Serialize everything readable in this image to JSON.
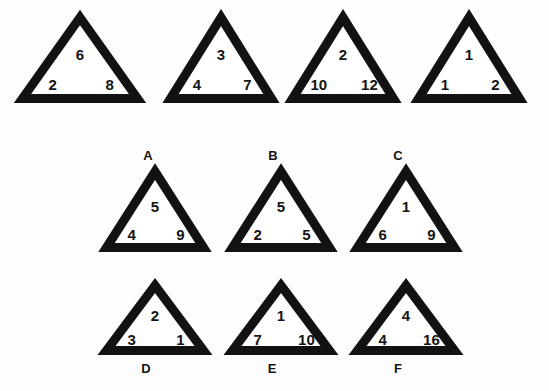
{
  "page": {
    "background_color": "#fdfdfd",
    "ink_color": "#121212",
    "kind": "numeric-analogy-triangle-puzzle"
  },
  "examples": [
    {
      "id": "example-1",
      "top": "6",
      "left": "2",
      "right": "8",
      "label": "",
      "box": {
        "x": 18,
        "y": 13,
        "w": 124,
        "h": 90
      },
      "stroke": 9
    },
    {
      "id": "example-2",
      "top": "3",
      "left": "4",
      "right": "7",
      "label": "",
      "box": {
        "x": 166,
        "y": 13,
        "w": 110,
        "h": 90
      },
      "stroke": 9
    },
    {
      "id": "example-3",
      "top": "2",
      "left": "10",
      "right": "12",
      "label": "",
      "box": {
        "x": 288,
        "y": 13,
        "w": 110,
        "h": 90
      },
      "stroke": 9
    },
    {
      "id": "example-4",
      "top": "1",
      "left": "1",
      "right": "2",
      "label": "",
      "box": {
        "x": 414,
        "y": 13,
        "w": 110,
        "h": 90
      },
      "stroke": 9
    }
  ],
  "options": [
    {
      "id": "option-a",
      "label": "A",
      "label_position": "above",
      "top": "5",
      "left": "4",
      "right": "9",
      "box": {
        "x": 102,
        "y": 167,
        "w": 106,
        "h": 85
      },
      "label_xy": {
        "x": 148,
        "y": 155
      },
      "stroke": 9
    },
    {
      "id": "option-b",
      "label": "B",
      "label_position": "above",
      "top": "5",
      "left": "2",
      "right": "5",
      "box": {
        "x": 228,
        "y": 167,
        "w": 106,
        "h": 85
      },
      "label_xy": {
        "x": 273,
        "y": 155
      },
      "stroke": 9
    },
    {
      "id": "option-c",
      "label": "C",
      "label_position": "above",
      "top": "1",
      "left": "6",
      "right": "9",
      "box": {
        "x": 353,
        "y": 167,
        "w": 106,
        "h": 85
      },
      "label_xy": {
        "x": 398,
        "y": 155
      },
      "stroke": 9
    },
    {
      "id": "option-d",
      "label": "D",
      "label_position": "below",
      "top": "2",
      "left": "3",
      "right": "1",
      "box": {
        "x": 102,
        "y": 281,
        "w": 106,
        "h": 74
      },
      "label_xy": {
        "x": 146,
        "y": 368
      },
      "stroke": 9
    },
    {
      "id": "option-e",
      "label": "E",
      "label_position": "below",
      "top": "1",
      "left": "7",
      "right": "10",
      "box": {
        "x": 228,
        "y": 281,
        "w": 106,
        "h": 74
      },
      "label_xy": {
        "x": 272,
        "y": 368
      },
      "stroke": 9
    },
    {
      "id": "option-f",
      "label": "F",
      "label_position": "below",
      "top": "4",
      "left": "4",
      "right": "16",
      "box": {
        "x": 353,
        "y": 281,
        "w": 106,
        "h": 74
      },
      "label_xy": {
        "x": 398,
        "y": 368
      },
      "stroke": 9
    }
  ]
}
